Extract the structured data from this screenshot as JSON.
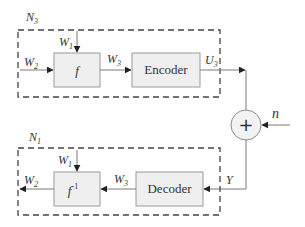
{
  "colors": {
    "line": "#7a7a7a",
    "dash": "#444444",
    "box_fill": "#efefef",
    "box_stroke": "#9a9a9a",
    "arrow": "#222222",
    "text": "#333333"
  },
  "transmitter": {
    "group_label": "N",
    "group_sub": "3",
    "inputs": {
      "w1": {
        "base": "W",
        "sub": "1"
      },
      "w2": {
        "base": "W",
        "sub": "2"
      },
      "w3": {
        "base": "W",
        "sub": "3"
      }
    },
    "function_block": {
      "base": "f"
    },
    "encoder_block": {
      "label": "Encoder"
    },
    "output": {
      "base": "U",
      "sub": "3"
    }
  },
  "channel": {
    "adder_symbol": "+",
    "noise_label": "n",
    "output_label": "Y"
  },
  "receiver": {
    "group_label": "N",
    "group_sub": "1",
    "inputs": {
      "w1": {
        "base": "W",
        "sub": "1"
      },
      "w2": {
        "base": "W",
        "sub": "2"
      },
      "w3": {
        "base": "W",
        "sub": "3"
      }
    },
    "inverse_block": {
      "base": "f",
      "sup": "-1"
    },
    "decoder_block": {
      "label": "Decoder"
    }
  }
}
